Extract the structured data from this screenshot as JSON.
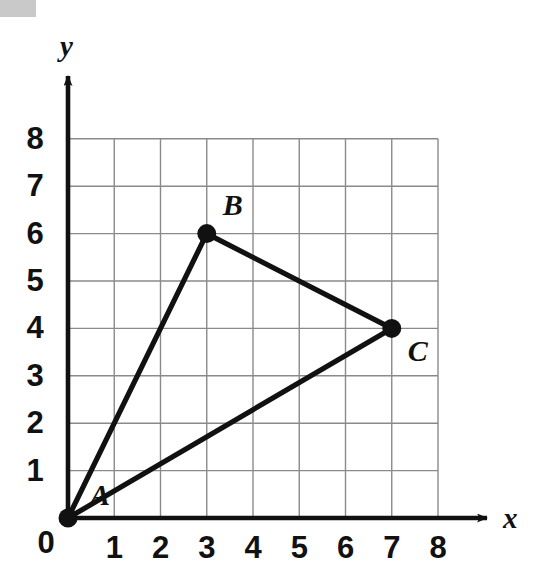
{
  "figure": {
    "background_color": "#ffffff",
    "ink_color": "#111111",
    "grid_color": "#8a8a8a",
    "artifact_color": "#c9c9c9"
  },
  "axes": {
    "x_name": "x",
    "y_name": "y",
    "origin_label": "0",
    "x_tick_labels": [
      "1",
      "2",
      "3",
      "4",
      "5",
      "6",
      "7",
      "8"
    ],
    "y_tick_labels": [
      "1",
      "2",
      "3",
      "4",
      "5",
      "6",
      "7",
      "8"
    ]
  },
  "chart_data": {
    "type": "scatter",
    "title": "",
    "subtitle": "",
    "xlabel": "x",
    "ylabel": "y",
    "xlim": [
      0,
      8
    ],
    "ylim": [
      0,
      8
    ],
    "xticks": [
      0,
      1,
      2,
      3,
      4,
      5,
      6,
      7,
      8
    ],
    "yticks": [
      0,
      1,
      2,
      3,
      4,
      5,
      6,
      7,
      8
    ],
    "grid": true,
    "legend": "none",
    "annotations": [
      "A",
      "B",
      "C"
    ],
    "shapes": [
      {
        "name": "triangle-ABC",
        "kind": "polygon",
        "closed": true,
        "filled": false,
        "stroke": "#111111",
        "vertices": [
          {
            "label": "A",
            "x": 0,
            "y": 0
          },
          {
            "label": "B",
            "x": 3,
            "y": 6
          },
          {
            "label": "C",
            "x": 7,
            "y": 4
          }
        ]
      }
    ],
    "points": [
      {
        "label": "A",
        "x": 0,
        "y": 0
      },
      {
        "label": "B",
        "x": 3,
        "y": 6
      },
      {
        "label": "C",
        "x": 7,
        "y": 4
      }
    ],
    "series": [
      {
        "name": "Triangle ABC vertices",
        "x": [
          0,
          3,
          7
        ],
        "y": [
          0,
          6,
          4
        ],
        "labels": [
          "A",
          "B",
          "C"
        ]
      }
    ]
  }
}
